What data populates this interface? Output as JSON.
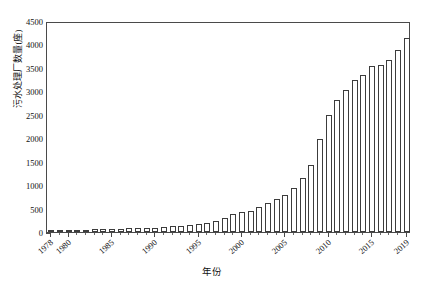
{
  "chart_data": {
    "type": "bar",
    "title": "",
    "xlabel": "年份",
    "ylabel": "污水处理厂数量(座)",
    "ylim": [
      0,
      4500
    ],
    "ytick_step": 500,
    "yminor_step": 100,
    "grid": false,
    "legend": null,
    "series_name": "污水处理厂数量",
    "bar_fill": "#ffffff",
    "bar_edge": "#3c3c3c",
    "axis_color": "#4a4a4a",
    "ytick_labels": [
      "4500",
      "4000",
      "3500",
      "3000",
      "2500",
      "2000",
      "1500",
      "1000",
      "500",
      "0"
    ],
    "ytick_values": [
      4500,
      4000,
      3500,
      3000,
      2500,
      2000,
      1500,
      1000,
      500,
      0
    ],
    "xtick_labels": [
      "1978",
      "1980",
      "1985",
      "1990",
      "1995",
      "2000",
      "2005",
      "2010",
      "2015",
      "2019"
    ],
    "categories": [
      "1978",
      "1979",
      "1980",
      "1981",
      "1982",
      "1983",
      "1984",
      "1985",
      "1986",
      "1987",
      "1988",
      "1989",
      "1990",
      "1991",
      "1992",
      "1993",
      "1994",
      "1995",
      "1996",
      "1997",
      "1998",
      "1999",
      "2000",
      "2001",
      "2002",
      "2003",
      "2004",
      "2005",
      "2006",
      "2007",
      "2008",
      "2009",
      "2010",
      "2011",
      "2012",
      "2013",
      "2014",
      "2015",
      "2016",
      "2017",
      "2018",
      "2019"
    ],
    "values": [
      37,
      40,
      43,
      47,
      52,
      58,
      63,
      68,
      72,
      78,
      84,
      90,
      96,
      105,
      118,
      128,
      142,
      163,
      190,
      235,
      307,
      387,
      427,
      452,
      537,
      612,
      708,
      792,
      939,
      1153,
      1420,
      1992,
      2496,
      2810,
      3022,
      3244,
      3345,
      3542,
      3552,
      3678,
      3878,
      4139
    ]
  }
}
